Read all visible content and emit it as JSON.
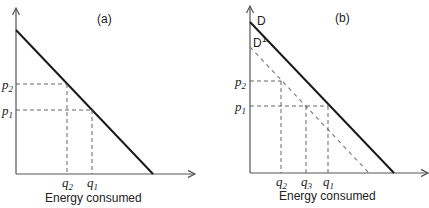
{
  "panels": [
    {
      "id": "a",
      "title": "(a)",
      "xlabel": "Energy consumed",
      "price_labels": [
        {
          "base": "p",
          "sub": "2"
        },
        {
          "base": "p",
          "sub": "1"
        }
      ],
      "quantity_labels": [
        {
          "base": "q",
          "sub": "2"
        },
        {
          "base": "q",
          "sub": "1"
        }
      ],
      "curves": []
    },
    {
      "id": "b",
      "title": "(b)",
      "xlabel": "Energy consumed",
      "price_labels": [
        {
          "base": "p",
          "sub": "2"
        },
        {
          "base": "p",
          "sub": "1"
        }
      ],
      "quantity_labels": [
        {
          "base": "q",
          "sub": "2"
        },
        {
          "base": "q",
          "sub": "3"
        },
        {
          "base": "q",
          "sub": "1"
        }
      ],
      "curves": [
        {
          "label": "D",
          "style": "solid"
        },
        {
          "label": "D",
          "sup": "1",
          "style": "dashed"
        }
      ]
    }
  ]
}
